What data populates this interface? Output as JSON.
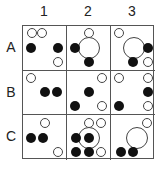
{
  "columns": [
    "1",
    "2",
    "3"
  ],
  "rows": [
    "A",
    "B",
    "C"
  ],
  "colors": {
    "filled": "#111111",
    "outline": "#444444",
    "grid": "#555555"
  },
  "cells": {
    "A1": [
      {
        "type": "hollow",
        "x": 20,
        "y": 17
      },
      {
        "type": "hollow",
        "x": 45,
        "y": 17
      },
      {
        "type": "filled",
        "x": 18,
        "y": 50
      },
      {
        "type": "filled",
        "x": 82,
        "y": 50
      },
      {
        "type": "hollow",
        "x": 82,
        "y": 82
      }
    ],
    "A2": [
      {
        "type": "hollow",
        "x": 50,
        "y": 17
      },
      {
        "type": "filled",
        "x": 18,
        "y": 50
      },
      {
        "type": "big",
        "x": 50,
        "y": 50
      },
      {
        "type": "filled",
        "x": 50,
        "y": 82
      }
    ],
    "A3": [
      {
        "type": "hollow",
        "x": 18,
        "y": 17
      },
      {
        "type": "big",
        "x": 52,
        "y": 50
      },
      {
        "type": "filled",
        "x": 84,
        "y": 50
      },
      {
        "type": "filled",
        "x": 50,
        "y": 82
      },
      {
        "type": "hollow",
        "x": 84,
        "y": 82
      }
    ],
    "B1": [
      {
        "type": "hollow",
        "x": 18,
        "y": 17
      },
      {
        "type": "filled",
        "x": 50,
        "y": 50
      },
      {
        "type": "filled",
        "x": 78,
        "y": 50
      }
    ],
    "B2": [
      {
        "type": "hollow",
        "x": 82,
        "y": 17
      },
      {
        "type": "filled",
        "x": 50,
        "y": 50
      },
      {
        "type": "filled",
        "x": 18,
        "y": 82
      },
      {
        "type": "hollow",
        "x": 82,
        "y": 82
      }
    ],
    "B3": [
      {
        "type": "hollow",
        "x": 18,
        "y": 17
      },
      {
        "type": "hollow",
        "x": 84,
        "y": 17
      },
      {
        "type": "filled",
        "x": 84,
        "y": 50
      },
      {
        "type": "filled",
        "x": 18,
        "y": 82
      },
      {
        "type": "hollow",
        "x": 84,
        "y": 82
      }
    ],
    "C1": [
      {
        "type": "hollow",
        "x": 50,
        "y": 17
      },
      {
        "type": "filled",
        "x": 18,
        "y": 50
      },
      {
        "type": "filled",
        "x": 46,
        "y": 50
      },
      {
        "type": "hollow",
        "x": 82,
        "y": 82
      }
    ],
    "C2": [
      {
        "type": "hollow",
        "x": 52,
        "y": 17
      },
      {
        "type": "hollow",
        "x": 80,
        "y": 17
      },
      {
        "type": "filled",
        "x": 20,
        "y": 50
      },
      {
        "type": "big",
        "x": 50,
        "y": 50
      },
      {
        "type": "filled",
        "x": 50,
        "y": 50
      },
      {
        "type": "filled",
        "x": 20,
        "y": 82
      },
      {
        "type": "filled",
        "x": 50,
        "y": 82
      },
      {
        "type": "hollow",
        "x": 80,
        "y": 82
      }
    ],
    "C3": [
      {
        "type": "hollow",
        "x": 82,
        "y": 17
      },
      {
        "type": "big",
        "x": 58,
        "y": 50
      },
      {
        "type": "filled",
        "x": 22,
        "y": 82
      },
      {
        "type": "filled",
        "x": 50,
        "y": 82
      }
    ]
  }
}
